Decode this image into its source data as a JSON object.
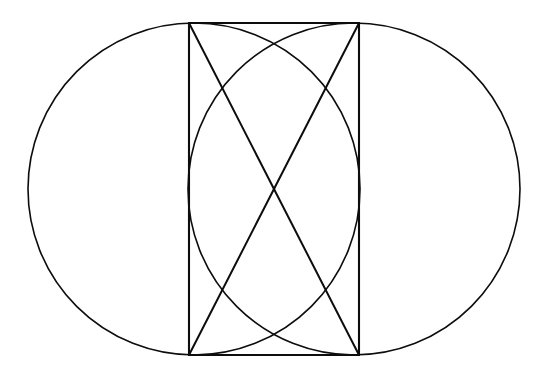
{
  "figure": {
    "background_color": "#ffffff",
    "stroke_color": "#0d0d0d",
    "canvas": {
      "width": 542,
      "height": 380
    }
  },
  "chart_data": {
    "type": "diagram",
    "xlabel": "",
    "ylabel": "",
    "grid": false,
    "legend": null,
    "xlim": [
      0,
      542
    ],
    "ylim": [
      0,
      380
    ],
    "elements": [
      {
        "name": "left-circle",
        "shape": "circle",
        "cx": 194,
        "cy": 189,
        "r": 166,
        "stroke": "#0d0d0d",
        "stroke_width": 1.6,
        "fill": "none"
      },
      {
        "name": "right-circle",
        "shape": "circle",
        "cx": 354,
        "cy": 189,
        "r": 166,
        "stroke": "#0d0d0d",
        "stroke_width": 1.6,
        "fill": "none"
      },
      {
        "name": "rectangle",
        "shape": "rect",
        "x": 189,
        "y": 23,
        "width": 170,
        "height": 332,
        "stroke": "#0d0d0d",
        "stroke_width": 2.1,
        "fill": "none"
      },
      {
        "name": "diagonal-tl-br",
        "shape": "line",
        "x1": 189,
        "y1": 23,
        "x2": 359,
        "y2": 355,
        "stroke": "#0d0d0d",
        "stroke_width": 2.0
      },
      {
        "name": "diagonal-tr-bl",
        "shape": "line",
        "x1": 359,
        "y1": 23,
        "x2": 189,
        "y2": 355,
        "stroke": "#0d0d0d",
        "stroke_width": 2.0
      }
    ],
    "key_points": [
      {
        "name": "rect-top-left",
        "x": 189,
        "y": 23
      },
      {
        "name": "rect-top-right",
        "x": 359,
        "y": 23
      },
      {
        "name": "rect-bottom-left",
        "x": 189,
        "y": 355
      },
      {
        "name": "rect-bottom-right",
        "x": 359,
        "y": 355
      },
      {
        "name": "diagonals-crossing-center",
        "x": 274,
        "y": 189
      },
      {
        "name": "left-circle-leftmost",
        "x": 28,
        "y": 189
      },
      {
        "name": "right-circle-rightmost",
        "x": 520,
        "y": 189
      },
      {
        "name": "circles-top-tangent",
        "y": 23
      },
      {
        "name": "circles-bottom-tangent",
        "y": 355
      },
      {
        "name": "arcs-upper-crossing",
        "x": 274,
        "y": 45
      },
      {
        "name": "arcs-lower-crossing",
        "x": 274,
        "y": 333
      }
    ],
    "measurements": {
      "circle_radius": 166,
      "circle_diameter": 332,
      "circle_center_separation": 160,
      "rectangle_width": 170,
      "rectangle_height": 332,
      "vertical_center": 189,
      "horizontal_center": 274
    }
  }
}
